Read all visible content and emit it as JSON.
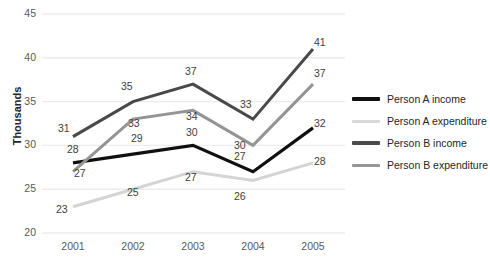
{
  "chart_data": {
    "type": "line",
    "title": "",
    "xlabel": "",
    "ylabel": "Thousands",
    "categories": [
      "2001",
      "2002",
      "2003",
      "2004",
      "2005"
    ],
    "ylim": [
      20,
      45
    ],
    "yticks": [
      "20",
      "25",
      "30",
      "35",
      "40",
      "45"
    ],
    "grid": true,
    "legend_position": "right",
    "series": [
      {
        "name": "Person A income",
        "color": "#101010",
        "width": 3.2,
        "values": [
          28,
          29,
          30,
          27,
          32
        ],
        "labels": [
          "28",
          "29",
          "30",
          "27",
          "32"
        ]
      },
      {
        "name": "Person A expenditure",
        "color": "#d4d4d4",
        "width": 3.0,
        "values": [
          23,
          25,
          27,
          26,
          28
        ],
        "labels": [
          "23",
          "25",
          "27",
          "26",
          "28"
        ]
      },
      {
        "name": "Person B income",
        "color": "#494949",
        "width": 3.0,
        "values": [
          31,
          35,
          37,
          33,
          41
        ],
        "labels": [
          "31",
          "35",
          "37",
          "33",
          "41"
        ]
      },
      {
        "name": "Person B expenditure",
        "color": "#949494",
        "width": 3.0,
        "values": [
          27,
          33,
          34,
          30,
          37
        ],
        "labels": [
          "27",
          "33",
          "34",
          "30",
          "37"
        ]
      }
    ]
  },
  "axis": {
    "y_title": "Thousands",
    "y_ticks": [
      "45",
      "40",
      "35",
      "30",
      "25",
      "20"
    ],
    "x_ticks": [
      "2001",
      "2002",
      "2003",
      "2004",
      "2005"
    ]
  },
  "legend": {
    "items": [
      {
        "label": "Person A income",
        "color": "#101010",
        "thickness": "3.4px"
      },
      {
        "label": "Person A expenditure",
        "color": "#d9d9d9",
        "thickness": "3.0px"
      },
      {
        "label": "Person B income",
        "color": "#4a4a4a",
        "thickness": "3.2px"
      },
      {
        "label": "Person B expenditure",
        "color": "#969696",
        "thickness": "3.0px"
      }
    ]
  },
  "style": {
    "background": "#ffffff",
    "gridline_color": "#ececec",
    "tick_text_color": "#595959",
    "label_text_color": "#404040"
  },
  "point_labels": [
    {
      "text": "31",
      "x": 58,
      "y": 122
    },
    {
      "text": "35",
      "x": 121,
      "y": 80
    },
    {
      "text": "37",
      "x": 185,
      "y": 65
    },
    {
      "text": "33",
      "x": 240,
      "y": 98
    },
    {
      "text": "41",
      "x": 314,
      "y": 36
    },
    {
      "text": "27",
      "x": 74,
      "y": 167
    },
    {
      "text": "33",
      "x": 128,
      "y": 117
    },
    {
      "text": "34",
      "x": 186,
      "y": 110
    },
    {
      "text": "30",
      "x": 234,
      "y": 139
    },
    {
      "text": "37",
      "x": 314,
      "y": 67
    },
    {
      "text": "28",
      "x": 67,
      "y": 143
    },
    {
      "text": "29",
      "x": 131,
      "y": 132
    },
    {
      "text": "30",
      "x": 186,
      "y": 126
    },
    {
      "text": "27",
      "x": 234,
      "y": 150
    },
    {
      "text": "32",
      "x": 314,
      "y": 117
    },
    {
      "text": "23",
      "x": 56,
      "y": 203
    },
    {
      "text": "25",
      "x": 127,
      "y": 186
    },
    {
      "text": "27",
      "x": 185,
      "y": 171
    },
    {
      "text": "26",
      "x": 234,
      "y": 190
    },
    {
      "text": "28",
      "x": 314,
      "y": 155
    }
  ]
}
